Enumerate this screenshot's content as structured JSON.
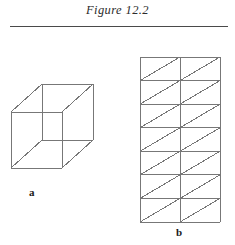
{
  "figure": {
    "title": "Figure 12.2",
    "rule_color": "#4a4a4a",
    "background": "#ffffff",
    "stroke_color": "#777777",
    "canvas": {
      "width": 235,
      "height": 245
    }
  },
  "parts": [
    {
      "id": "a",
      "label": "a",
      "type": "wireframe-rectangular-box",
      "description": "three-dimensional rectangular prism drawn in oblique projection, all twelve edges visible",
      "label_position": {
        "x": 33,
        "y": 193
      },
      "front_face": {
        "left": 11,
        "top": 112,
        "right": 62,
        "bottom": 168
      },
      "depth_offset": {
        "dx": 31,
        "dy": -28
      },
      "vertices": {
        "front_top_left": {
          "x": 11,
          "y": 112
        },
        "front_top_right": {
          "x": 62,
          "y": 112
        },
        "front_bottom_left": {
          "x": 11,
          "y": 168
        },
        "front_bottom_right": {
          "x": 62,
          "y": 168
        },
        "back_top_left": {
          "x": 42,
          "y": 84
        },
        "back_top_right": {
          "x": 93,
          "y": 84
        },
        "back_bottom_left": {
          "x": 42,
          "y": 140
        },
        "back_bottom_right": {
          "x": 93,
          "y": 140
        }
      }
    },
    {
      "id": "b",
      "label": "b",
      "type": "diagonal-divided-grid",
      "description": "rectangular grid of two columns by seven rows, each cell crossed by a diagonal from its lower-left corner to its upper-right corner",
      "label_position": {
        "x": 180,
        "y": 233
      },
      "bounds": {
        "left": 140,
        "top": 57,
        "right": 220,
        "bottom": 222
      },
      "columns": 2,
      "rows": 7,
      "cell_width": 40,
      "cell_height": 23.57,
      "diagonal_direction": "bottom-left-to-top-right"
    }
  ]
}
